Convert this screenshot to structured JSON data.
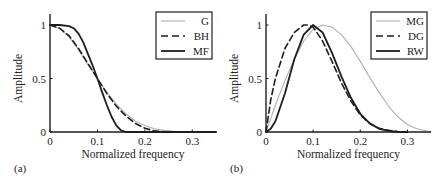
{
  "chart_data": [
    {
      "panel_label": "(a)",
      "type": "line",
      "xlabel": "Normalized frequency",
      "ylabel": "Amplitude",
      "xlim": [
        0,
        0.35
      ],
      "ylim": [
        0,
        1.1
      ],
      "xticks": [
        "0",
        "0.1",
        "0.2",
        "0.3"
      ],
      "yticks": [
        "0",
        "0.5",
        "1"
      ],
      "grid": false,
      "legend_position": "upper right",
      "series": [
        {
          "name": "G",
          "style": "thin-gray",
          "color": "#aaaaaa",
          "x": [
            0,
            0.02,
            0.04,
            0.06,
            0.08,
            0.1,
            0.12,
            0.14,
            0.16,
            0.18,
            0.2,
            0.22,
            0.24,
            0.26,
            0.3,
            0.35
          ],
          "y": [
            1,
            0.97,
            0.89,
            0.77,
            0.63,
            0.5,
            0.37,
            0.26,
            0.17,
            0.1,
            0.06,
            0.03,
            0.015,
            0.007,
            0.001,
            0
          ]
        },
        {
          "name": "BH",
          "style": "dashed",
          "color": "#222222",
          "x": [
            0,
            0.02,
            0.04,
            0.06,
            0.08,
            0.1,
            0.12,
            0.14,
            0.16,
            0.18,
            0.2,
            0.22,
            0.24,
            0.26,
            0.3,
            0.35
          ],
          "y": [
            1,
            0.97,
            0.9,
            0.78,
            0.64,
            0.5,
            0.36,
            0.24,
            0.15,
            0.08,
            0.035,
            0.01,
            0.002,
            0,
            0,
            0
          ]
        },
        {
          "name": "MF",
          "style": "solid-thick",
          "color": "#222222",
          "x": [
            0,
            0.02,
            0.04,
            0.05,
            0.06,
            0.07,
            0.08,
            0.09,
            0.1,
            0.11,
            0.12,
            0.13,
            0.14,
            0.15,
            0.16,
            0.2,
            0.35
          ],
          "y": [
            1,
            1,
            0.99,
            0.97,
            0.92,
            0.84,
            0.73,
            0.62,
            0.5,
            0.37,
            0.25,
            0.14,
            0.06,
            0.015,
            0,
            0,
            0
          ]
        }
      ]
    },
    {
      "panel_label": "(b)",
      "type": "line",
      "xlabel": "Normalized frequency",
      "ylabel": "Amplitude",
      "xlim": [
        0,
        0.35
      ],
      "ylim": [
        0,
        1.1
      ],
      "xticks": [
        "0",
        "0.1",
        "0.2",
        "0.3"
      ],
      "yticks": [
        "0",
        "0.5",
        "1"
      ],
      "grid": false,
      "legend_position": "upper right",
      "series": [
        {
          "name": "MG",
          "style": "thin-gray",
          "color": "#aaaaaa",
          "x": [
            0,
            0.02,
            0.04,
            0.06,
            0.08,
            0.1,
            0.12,
            0.14,
            0.16,
            0.18,
            0.2,
            0.22,
            0.24,
            0.26,
            0.28,
            0.3,
            0.32,
            0.35
          ],
          "y": [
            0,
            0.25,
            0.48,
            0.68,
            0.85,
            0.96,
            1,
            0.98,
            0.91,
            0.8,
            0.66,
            0.51,
            0.37,
            0.24,
            0.14,
            0.07,
            0.03,
            0
          ]
        },
        {
          "name": "DG",
          "style": "dashed",
          "color": "#222222",
          "x": [
            0,
            0.01,
            0.02,
            0.04,
            0.06,
            0.08,
            0.09,
            0.1,
            0.12,
            0.14,
            0.16,
            0.18,
            0.2,
            0.22,
            0.24,
            0.26,
            0.28,
            0.3
          ],
          "y": [
            0,
            0.3,
            0.5,
            0.78,
            0.93,
            1,
            1,
            0.98,
            0.85,
            0.66,
            0.46,
            0.29,
            0.16,
            0.08,
            0.035,
            0.015,
            0.005,
            0
          ]
        },
        {
          "name": "RW",
          "style": "solid-thick",
          "color": "#222222",
          "x": [
            0,
            0.01,
            0.02,
            0.04,
            0.06,
            0.08,
            0.1,
            0.12,
            0.14,
            0.16,
            0.18,
            0.2,
            0.22,
            0.24,
            0.26,
            0.28,
            0.3
          ],
          "y": [
            0,
            0.03,
            0.1,
            0.36,
            0.68,
            0.91,
            1,
            0.93,
            0.74,
            0.52,
            0.32,
            0.17,
            0.08,
            0.03,
            0.01,
            0,
            0
          ]
        }
      ]
    }
  ]
}
